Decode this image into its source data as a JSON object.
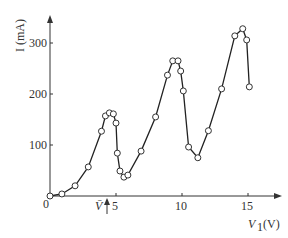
{
  "chart_data": {
    "type": "line",
    "title": "",
    "xlabel": "V1 (V)",
    "ylabel": "I (mA)",
    "x_ticks": [
      0,
      5,
      10,
      15
    ],
    "y_ticks": [
      100,
      200,
      300
    ],
    "annotation": "V̄ (arrow, near V1≈4.5)",
    "xlim": [
      0,
      17
    ],
    "ylim": [
      0,
      350
    ],
    "grid": false,
    "series": [
      {
        "name": "I",
        "points": [
          [
            0,
            0
          ],
          [
            0.9,
            4
          ],
          [
            1.9,
            20
          ],
          [
            2.9,
            57
          ],
          [
            3.9,
            127
          ],
          [
            4.2,
            157
          ],
          [
            4.5,
            163
          ],
          [
            4.8,
            161
          ],
          [
            5.0,
            143
          ],
          [
            5.1,
            84
          ],
          [
            5.3,
            49
          ],
          [
            5.6,
            37
          ],
          [
            5.9,
            41
          ],
          [
            6.9,
            88
          ],
          [
            8.0,
            155
          ],
          [
            8.9,
            237
          ],
          [
            9.3,
            265
          ],
          [
            9.7,
            265
          ],
          [
            9.9,
            245
          ],
          [
            10.1,
            206
          ],
          [
            10.5,
            96
          ],
          [
            11.2,
            75
          ],
          [
            12.0,
            128
          ],
          [
            13.0,
            210
          ],
          [
            14.0,
            314
          ],
          [
            14.6,
            328
          ],
          [
            14.9,
            306
          ],
          [
            15.1,
            214
          ]
        ]
      }
    ]
  },
  "labels": {
    "y_axis": "I (mA)",
    "x_axis": "V",
    "x_sub": "1",
    "x_unit": "(V)",
    "vbar": "V̄",
    "t0": "0",
    "t5": "5",
    "t10": "10",
    "t15": "15",
    "y100": "100",
    "y200": "200",
    "y300": "300"
  }
}
